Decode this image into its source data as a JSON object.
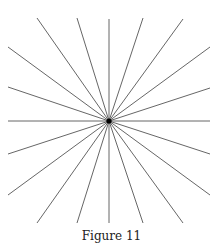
{
  "caption": "Figure 11",
  "diagram": {
    "type": "radiating-lines",
    "center": [
      109,
      121
    ],
    "line_color": "#555555",
    "center_dot_color": "#000000",
    "endpoints": [
      [
        37,
        18
      ],
      [
        77,
        18
      ],
      [
        109,
        19
      ],
      [
        143,
        18
      ],
      [
        183,
        19
      ],
      [
        210,
        47
      ],
      [
        210,
        88
      ],
      [
        210,
        121
      ],
      [
        210,
        154
      ],
      [
        210,
        195
      ],
      [
        183,
        223
      ],
      [
        143,
        223
      ],
      [
        109,
        223
      ],
      [
        77,
        223
      ],
      [
        37,
        223
      ],
      [
        8,
        195
      ],
      [
        8,
        154
      ],
      [
        8,
        121
      ],
      [
        8,
        87
      ],
      [
        8,
        47
      ]
    ]
  }
}
